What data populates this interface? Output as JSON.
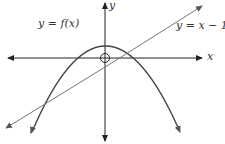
{
  "diagram": {
    "type": "function-graph",
    "labels": {
      "curve": "y = f(x)",
      "line": "y = x − 1",
      "x_axis": "x",
      "y_axis": "y"
    },
    "colors": {
      "axes": "#222222",
      "curve": "#444444",
      "line": "#666666"
    },
    "elements": [
      {
        "kind": "axis",
        "name": "x-axis",
        "direction": "horizontal"
      },
      {
        "kind": "axis",
        "name": "y-axis",
        "direction": "vertical"
      },
      {
        "kind": "curve",
        "name": "parabola",
        "shape": "downward-opening parabola"
      },
      {
        "kind": "line",
        "name": "line y=x-1",
        "slope": 1,
        "intercept": -1
      },
      {
        "kind": "marker",
        "name": "origin-open-circle"
      }
    ]
  }
}
